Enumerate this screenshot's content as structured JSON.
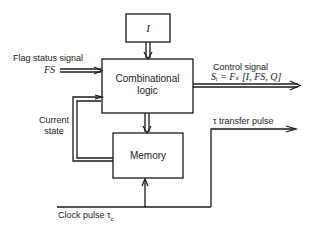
{
  "diagram": {
    "blocks": {
      "input": {
        "label": "I"
      },
      "combinational": {
        "line1": "Combinational",
        "line2": "logic"
      },
      "memory": {
        "label": "Memory"
      }
    },
    "signals": {
      "flag_status": {
        "title": "Flag status signal",
        "symbol": "FS"
      },
      "control": {
        "title": "Control signal",
        "formula": "Sᵢ = Fₛ [I, FS, Q]"
      },
      "current_state": {
        "line1": "Current",
        "line2": "state"
      },
      "transfer_pulse": {
        "label": "τ transfer pulse"
      },
      "clock": {
        "label": "Clock pulse τ",
        "subscript": "c"
      }
    },
    "colors": {
      "stroke": "#1a1a1a",
      "background": "#ffffff"
    }
  }
}
